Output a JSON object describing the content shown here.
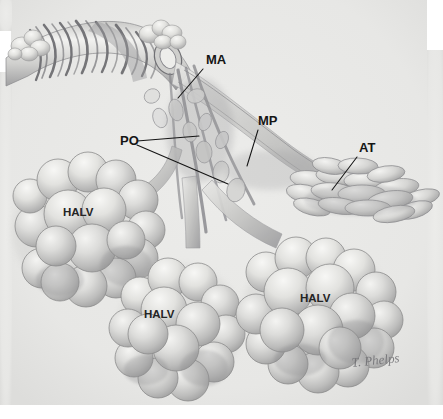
{
  "figure": {
    "kind": "anatomical-illustration",
    "medium": "graphite pencil rendering, grayscale",
    "background_color": "#e9e9e7",
    "paper_color": "#ffffff",
    "ink_color": "#151515",
    "width": 443,
    "height": 419
  },
  "callouts": [
    {
      "id": "MA",
      "label": "MA",
      "meaning": "muscular artery / alveolar duct opening",
      "label_x": 206,
      "label_y": 64,
      "leader": [
        [
          203,
          69
        ],
        [
          178,
          98
        ]
      ]
    },
    {
      "id": "MP",
      "label": "MP",
      "meaning": "muscle of pulmonary duct",
      "label_x": 258,
      "label_y": 125,
      "leader": [
        [
          258,
          130
        ],
        [
          247,
          166
        ]
      ]
    },
    {
      "id": "PO",
      "label": "PO",
      "meaning": "pore / opening",
      "label_x": 120,
      "label_y": 145,
      "leader_a": [
        [
          137,
          141
        ],
        [
          199,
          136
        ]
      ],
      "leader_b": [
        [
          137,
          145
        ],
        [
          228,
          184
        ]
      ]
    },
    {
      "id": "AT",
      "label": "AT",
      "meaning": "alveolar tube / atrium",
      "label_x": 359,
      "label_y": 152,
      "leader": [
        [
          357,
          157
        ],
        [
          332,
          190
        ]
      ]
    }
  ],
  "structure_labels": [
    {
      "id": "halv-left",
      "label": "HALV",
      "x": 63,
      "y": 216
    },
    {
      "id": "halv-middle",
      "label": "HALV",
      "x": 144,
      "y": 318
    },
    {
      "id": "halv-right",
      "label": "HALV",
      "x": 300,
      "y": 302
    }
  ],
  "signature": {
    "text": "T. Phelps",
    "x": 352,
    "y": 367
  },
  "regions": [
    {
      "name": "bronchiole-with-spiral-muscle",
      "note": "upper-left airway with helical smooth-muscle bands"
    },
    {
      "name": "alveolar-duct-branch",
      "note": "central branching ducts"
    },
    {
      "name": "alveolar-tube-cluster",
      "note": "elongated sacs at right, labelled AT"
    },
    {
      "name": "alveolar-sac-cluster-left",
      "note": "grape-like cluster, labelled HALV"
    },
    {
      "name": "alveolar-sac-cluster-middle",
      "note": "grape-like cluster, labelled HALV"
    },
    {
      "name": "alveolar-sac-cluster-right",
      "note": "grape-like cluster, labelled HALV"
    }
  ]
}
